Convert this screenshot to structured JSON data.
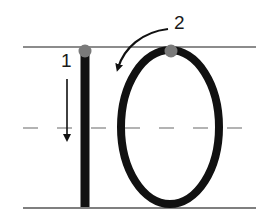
{
  "steps": [
    {
      "number": "1",
      "stroke": "vertical line drawn downward"
    },
    {
      "number": "2",
      "stroke": "oval drawn counter-clockwise from top"
    }
  ],
  "guides": {
    "top_line": "solid",
    "mid_line": "dashed",
    "bottom_line": "solid"
  },
  "colors": {
    "stroke": "#111111",
    "start_dot": "#7a7a7a",
    "guide_line": "#666666",
    "dashed_line": "#9a9a9a",
    "arrow": "#111111"
  }
}
